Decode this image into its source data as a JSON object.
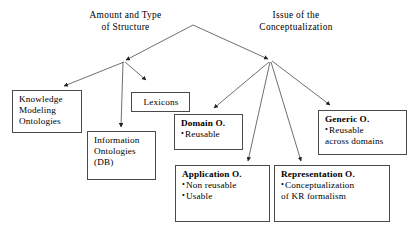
{
  "diagram": {
    "background_color": "#ffffff",
    "line_color": "#555555",
    "box_border_color": "#4a4a4a",
    "text_color": "#000000",
    "root_labels": [
      {
        "id": "amount-and-type-of-structure",
        "line1": "Amount and Type",
        "line2": "of Structure"
      },
      {
        "id": "issue-of-the-conceptualization",
        "line1": "Issue of the",
        "line2": "Conceptualization"
      }
    ],
    "nodes": [
      {
        "id": "knowledge-modeling-ontologies",
        "title": "",
        "lines": [
          "Knowledge",
          "Modeling",
          "Ontologies"
        ],
        "bold_title": false
      },
      {
        "id": "information-ontologies-db",
        "title": "",
        "lines": [
          "Information",
          "Ontologies",
          "(DB)"
        ],
        "bold_title": false
      },
      {
        "id": "lexicons",
        "title": "",
        "lines": [
          "Lexicons"
        ],
        "bold_title": false
      },
      {
        "id": "domain-ontology",
        "title": "Domain O.",
        "bullets": [
          "Reusable"
        ],
        "bold_title": true
      },
      {
        "id": "application-ontology",
        "title": "Application O.",
        "bullets": [
          "Non reusable",
          "Usable"
        ],
        "bold_title": true
      },
      {
        "id": "representation-ontology",
        "title": "Representation O.",
        "bullets": [
          "Conceptualization"
        ],
        "plain": [
          "of KR formalism"
        ],
        "bold_title": true
      },
      {
        "id": "generic-ontology",
        "title": "Generic O.",
        "bullets": [
          "Reusable"
        ],
        "plain": [
          "across domains"
        ],
        "bold_title": true
      }
    ],
    "edges": [
      {
        "from": "apex",
        "to": "left-junction"
      },
      {
        "from": "apex",
        "to": "right-junction"
      },
      {
        "from": "left-junction",
        "to": "knowledge-modeling-ontologies"
      },
      {
        "from": "left-junction",
        "to": "information-ontologies-db"
      },
      {
        "from": "left-junction",
        "to": "lexicons"
      },
      {
        "from": "right-junction",
        "to": "domain-ontology"
      },
      {
        "from": "right-junction",
        "to": "application-ontology"
      },
      {
        "from": "right-junction",
        "to": "representation-ontology"
      },
      {
        "from": "right-junction",
        "to": "generic-ontology"
      }
    ]
  }
}
